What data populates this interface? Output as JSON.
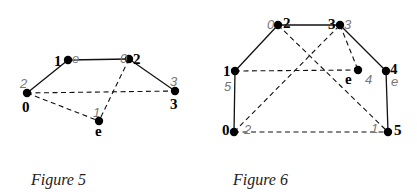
{
  "figures": [
    {
      "caption": "Figure 5",
      "nodes": [
        {
          "id": "0",
          "label": "0",
          "order_label": "2"
        },
        {
          "id": "1",
          "label": "1",
          "order_label": "e"
        },
        {
          "id": "2",
          "label": "2",
          "order_label": "0"
        },
        {
          "id": "3",
          "label": "3",
          "order_label": "3"
        },
        {
          "id": "e",
          "label": "e",
          "order_label": "1"
        }
      ],
      "edges": [
        {
          "from": "0",
          "to": "1",
          "style": "solid"
        },
        {
          "from": "1",
          "to": "2",
          "style": "solid"
        },
        {
          "from": "2",
          "to": "3",
          "style": "solid"
        },
        {
          "from": "0",
          "to": "3",
          "style": "dashed"
        },
        {
          "from": "0",
          "to": "e",
          "style": "dashed"
        },
        {
          "from": "2",
          "to": "e",
          "style": "dashed"
        }
      ]
    },
    {
      "caption": "Figure 6",
      "nodes": [
        {
          "id": "0",
          "label": "0",
          "order_label": "2"
        },
        {
          "id": "1",
          "label": "1",
          "order_label": "5"
        },
        {
          "id": "2",
          "label": "2",
          "order_label": "0"
        },
        {
          "id": "3",
          "label": "3",
          "order_label": "3"
        },
        {
          "id": "e",
          "label": "e",
          "order_label": "4"
        },
        {
          "id": "4",
          "label": "4",
          "order_label": "e"
        },
        {
          "id": "5",
          "label": "5",
          "order_label": "1"
        }
      ],
      "edges": [
        {
          "from": "0",
          "to": "1",
          "style": "solid"
        },
        {
          "from": "1",
          "to": "2",
          "style": "solid"
        },
        {
          "from": "2",
          "to": "3",
          "style": "solid"
        },
        {
          "from": "3",
          "to": "4",
          "style": "solid"
        },
        {
          "from": "4",
          "to": "5",
          "style": "solid"
        },
        {
          "from": "0",
          "to": "5",
          "style": "dashed"
        },
        {
          "from": "1",
          "to": "e",
          "style": "dashed"
        },
        {
          "from": "3",
          "to": "e",
          "style": "dashed"
        },
        {
          "from": "0",
          "to": "3",
          "style": "dashed"
        },
        {
          "from": "2",
          "to": "5",
          "style": "dashed"
        }
      ]
    }
  ]
}
